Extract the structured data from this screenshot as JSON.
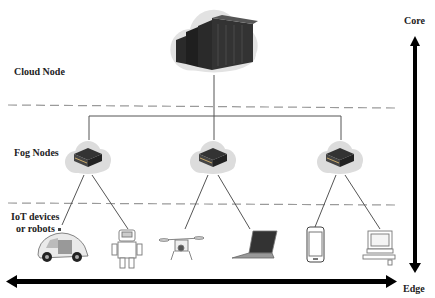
{
  "labels": {
    "cloud_node": "Cloud Node",
    "fog_nodes": "Fog Nodes",
    "iot_line1": "IoT devices",
    "iot_line2": "or robots",
    "core": "Core",
    "edge": "Edge"
  },
  "nodes": {
    "cloud": {
      "icon": "server-rack-icon"
    },
    "fog": [
      {
        "icon": "fog-server-icon"
      },
      {
        "icon": "fog-server-icon"
      },
      {
        "icon": "fog-server-icon"
      }
    ],
    "devices": [
      {
        "name": "self-driving-car",
        "icon": "car-icon"
      },
      {
        "name": "robot",
        "icon": "robot-icon"
      },
      {
        "name": "drone",
        "icon": "drone-icon"
      },
      {
        "name": "laptop",
        "icon": "laptop-icon"
      },
      {
        "name": "smartphone",
        "icon": "smartphone-icon"
      },
      {
        "name": "desktop-computer",
        "icon": "desktop-icon"
      }
    ]
  },
  "colors": {
    "line": "#555555",
    "dashed": "#9a9a9a",
    "cloud": "#d8d8d8",
    "server": "#2e2e2e",
    "arrow": "#000000"
  }
}
